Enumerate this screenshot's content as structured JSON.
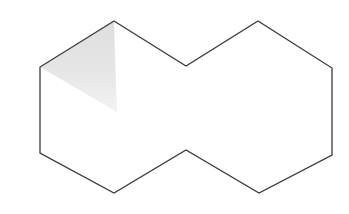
{
  "canvas": {
    "width": 349,
    "height": 214,
    "background_color": "#ffffff"
  },
  "figure": {
    "name": "decagon-outline-with-shaded-triangle",
    "outline": {
      "label": "decagon-outline",
      "stroke_color": "#3a3a3a",
      "stroke_width": 1.3,
      "fill_color": "#ffffff",
      "vertex_count": 10,
      "points": "114,21 186,66 258,21 332,68 332,155 259,193 186,150 114,193 40,153 40,67",
      "vertices": [
        {
          "name": "top-left-peak",
          "x": 114,
          "y": 21
        },
        {
          "name": "top-center-notch",
          "x": 186,
          "y": 66
        },
        {
          "name": "top-right-peak",
          "x": 258,
          "y": 21
        },
        {
          "name": "right-upper",
          "x": 332,
          "y": 68
        },
        {
          "name": "right-lower",
          "x": 332,
          "y": 155
        },
        {
          "name": "bottom-right-valley",
          "x": 259,
          "y": 193
        },
        {
          "name": "bottom-center-peak",
          "x": 186,
          "y": 150
        },
        {
          "name": "bottom-left-valley",
          "x": 114,
          "y": 193
        },
        {
          "name": "left-lower",
          "x": 40,
          "y": 153
        },
        {
          "name": "left-upper",
          "x": 40,
          "y": 67
        }
      ]
    },
    "shaded_region": {
      "label": "shaded-triangle",
      "fill_color": "#e4e4e4",
      "fill_opacity": 1,
      "stroke": "none",
      "points": "40,67 114,21 117,112",
      "vertices": [
        {
          "name": "triangle-left",
          "x": 40,
          "y": 67
        },
        {
          "name": "triangle-apex",
          "x": 114,
          "y": 21
        },
        {
          "name": "triangle-bottom",
          "x": 117,
          "y": 112
        }
      ]
    }
  }
}
